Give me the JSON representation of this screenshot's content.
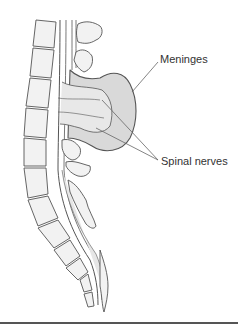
{
  "figure": {
    "type": "anatomical-diagram",
    "labels": [
      {
        "id": "meninges",
        "text": "Meninges"
      },
      {
        "id": "spinal_nerves",
        "text": "Spinal nerves"
      }
    ],
    "colors": {
      "outline": "#555555",
      "sac_fill": "#d9d9d9",
      "bone_fill": "#f2f2f2",
      "canal_fill": "#e6e6e6",
      "text": "#333333",
      "rule": "#555555"
    }
  }
}
